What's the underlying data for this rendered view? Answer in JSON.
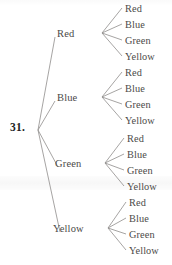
{
  "figure": {
    "item_number": "31.",
    "type": "probability-tree-diagram",
    "line_color": "#8f8d8b",
    "text_color": "#4b4a48",
    "background_color": "#ffffff"
  },
  "tree": {
    "root": {
      "x": 38,
      "y": 130
    },
    "level1": [
      {
        "label": "Red",
        "label_x": 57,
        "label_y": 28,
        "node_x": 97,
        "node_y": 33
      },
      {
        "label": "Blue",
        "label_x": 57,
        "label_y": 92,
        "node_x": 97,
        "node_y": 97
      },
      {
        "label": "Green",
        "label_x": 55,
        "label_y": 158,
        "node_x": 100,
        "node_y": 163
      },
      {
        "label": "Yellow",
        "label_x": 53,
        "label_y": 223,
        "node_x": 102,
        "node_y": 228
      }
    ],
    "leaf_groups": [
      {
        "parent": "Red",
        "apex_x": 102,
        "apex_y": 33,
        "leaves": [
          {
            "label": "Red",
            "x": 125,
            "y": 3
          },
          {
            "label": "Blue",
            "x": 125,
            "y": 19
          },
          {
            "label": "Green",
            "x": 125,
            "y": 35
          },
          {
            "label": "Yellow",
            "x": 125,
            "y": 51
          }
        ]
      },
      {
        "parent": "Blue",
        "apex_x": 102,
        "apex_y": 97,
        "leaves": [
          {
            "label": "Red",
            "x": 125,
            "y": 67
          },
          {
            "label": "Blue",
            "x": 125,
            "y": 83
          },
          {
            "label": "Green",
            "x": 125,
            "y": 99
          },
          {
            "label": "Yellow",
            "x": 125,
            "y": 115
          }
        ]
      },
      {
        "parent": "Green",
        "apex_x": 105,
        "apex_y": 163,
        "leaves": [
          {
            "label": "Red",
            "x": 127,
            "y": 133
          },
          {
            "label": "Blue",
            "x": 127,
            "y": 149
          },
          {
            "label": "Green",
            "x": 127,
            "y": 165
          },
          {
            "label": "Yellow",
            "x": 127,
            "y": 181
          }
        ]
      },
      {
        "parent": "Yellow",
        "apex_x": 108,
        "apex_y": 228,
        "leaves": [
          {
            "label": "Red",
            "x": 129,
            "y": 197
          },
          {
            "label": "Blue",
            "x": 129,
            "y": 213
          },
          {
            "label": "Green",
            "x": 129,
            "y": 229
          },
          {
            "label": "Yellow",
            "x": 129,
            "y": 245
          }
        ]
      }
    ]
  }
}
